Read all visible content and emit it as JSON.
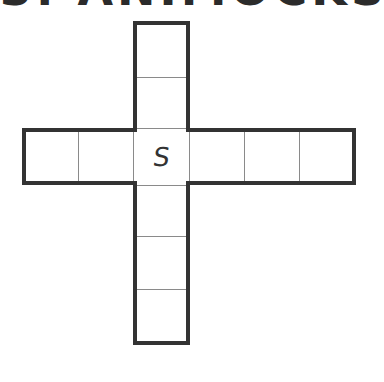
{
  "title": "3. ANIMOCKS",
  "puzzle": {
    "type": "cross-word-grid",
    "center_letter": "S",
    "horizontal_cells": 6,
    "vertical_cells": 6,
    "center_index_horizontal": 2,
    "center_index_vertical": 2,
    "colors": {
      "border": "#333333",
      "divider": "#8a8a8a",
      "background": "#ffffff"
    }
  }
}
